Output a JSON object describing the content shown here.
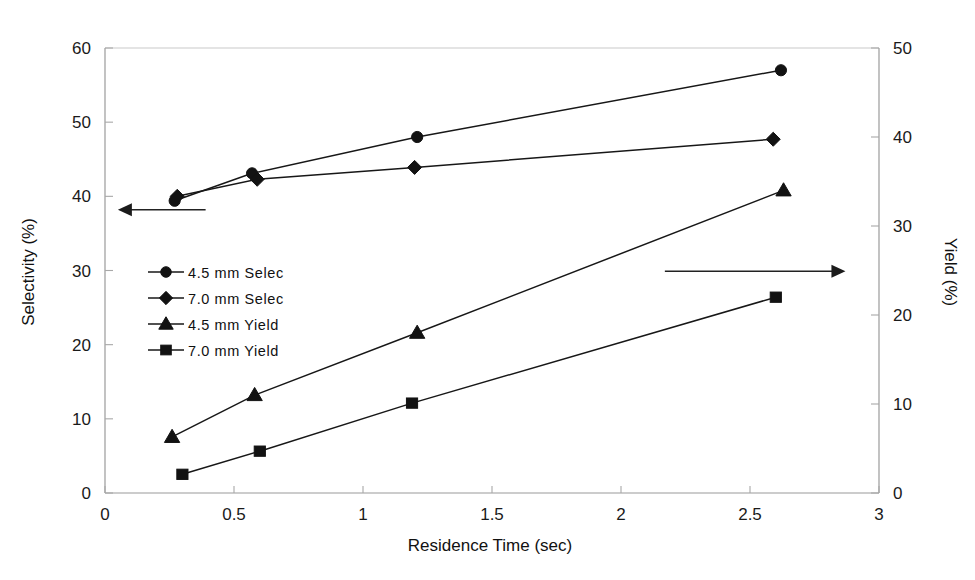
{
  "chart_data": {
    "type": "line",
    "title": "",
    "subtitle": "",
    "xlabel": "Residence Time (sec)",
    "ylabel": "Selectivity (%)",
    "y2label": "Yield (%)",
    "xlim": [
      0,
      3
    ],
    "ylim": [
      0,
      60
    ],
    "y2lim": [
      0,
      50
    ],
    "xticks": [
      "0",
      "0.5",
      "1",
      "1.5",
      "2",
      "2.5",
      "3"
    ],
    "xtick_values": [
      0,
      0.5,
      1,
      1.5,
      2,
      2.5,
      3
    ],
    "yticks": [
      "0",
      "10",
      "20",
      "30",
      "40",
      "50",
      "60"
    ],
    "ytick_values": [
      0,
      10,
      20,
      30,
      40,
      50,
      60
    ],
    "y2ticks": [
      "0",
      "10",
      "20",
      "30",
      "40",
      "50"
    ],
    "y2tick_values": [
      0,
      10,
      20,
      30,
      40,
      50
    ],
    "grid": false,
    "legend_position": "inside-left-middle",
    "marker_color": "#121212",
    "line_color": "#171717",
    "frame_color": "#c9c9c9",
    "series": [
      {
        "name": "4.5 mm Selec",
        "marker": "circle",
        "axis": "left",
        "x": [
          0.27,
          0.57,
          1.21,
          2.62
        ],
        "values": [
          39.4,
          43.1,
          48.0,
          57.0
        ]
      },
      {
        "name": "7.0 mm Selec",
        "marker": "diamond",
        "axis": "left",
        "x": [
          0.28,
          0.59,
          1.2,
          2.59
        ],
        "values": [
          40.0,
          42.3,
          43.9,
          47.7
        ]
      },
      {
        "name": "4.5 mm Yield",
        "marker": "triangle",
        "axis": "right",
        "x": [
          0.26,
          0.58,
          1.21,
          2.63
        ],
        "values": [
          6.3,
          11.0,
          18.0,
          34.0
        ]
      },
      {
        "name": "7.0 mm Yield",
        "marker": "square",
        "axis": "right",
        "x": [
          0.3,
          0.6,
          1.19,
          2.6
        ],
        "values": [
          2.1,
          4.7,
          10.1,
          22.0
        ]
      }
    ],
    "annotations": [
      {
        "name": "left-axis-arrow",
        "text": "",
        "direction": "left",
        "from_x": 0.39,
        "from_y": 38.2,
        "to_x": 0.05,
        "to_y": 38.2
      },
      {
        "name": "right-axis-arrow",
        "text": "",
        "direction": "right",
        "from_x": 2.17,
        "from_y": 29.9,
        "to_x": 2.87,
        "to_y": 29.9
      }
    ]
  },
  "legend": {
    "items": [
      {
        "label": "4.5 mm Selec",
        "marker": "circle"
      },
      {
        "label": "7.0 mm Selec",
        "marker": "diamond"
      },
      {
        "label": "4.5 mm Yield",
        "marker": "triangle"
      },
      {
        "label": "7.0 mm Yield",
        "marker": "square"
      }
    ]
  }
}
